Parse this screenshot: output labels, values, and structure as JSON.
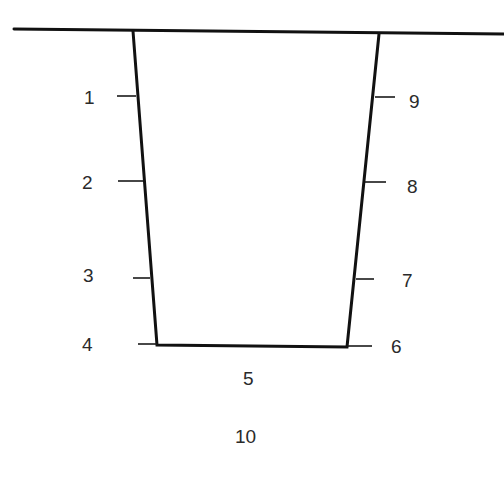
{
  "diagram": {
    "type": "trapezoidal trench cross-section",
    "stroke_color": "#111111",
    "label_color": "#2a2a2a",
    "left_labels": [
      "1",
      "2",
      "3",
      "4"
    ],
    "right_labels": [
      "9",
      "8",
      "7",
      "6"
    ],
    "bottom_label": "5",
    "below_label": "10",
    "labels": {
      "l1": "1",
      "l2": "2",
      "l3": "3",
      "l4": "4",
      "l5": "5",
      "l6": "6",
      "l7": "7",
      "l8": "8",
      "l9": "9",
      "l10": "10"
    }
  }
}
